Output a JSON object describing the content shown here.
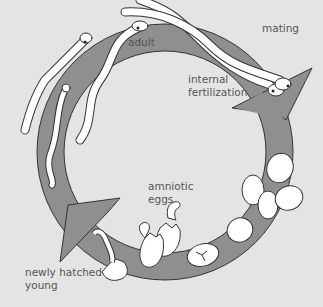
{
  "diagram": {
    "colors": {
      "background": "#e4e4e4",
      "ring": "#8f8f8f",
      "outline": "#333333",
      "animal_fill": "#ffffff",
      "label_text": "#555555"
    },
    "labels": {
      "mating": "mating",
      "adult": "adult",
      "internal_fertilization_1": "internal",
      "internal_fertilization_2": "fertilization",
      "amniotic_eggs_1": "amniotic",
      "amniotic_eggs_2": "eggs",
      "newly_hatched_1": "newly hatched",
      "newly_hatched_2": "young"
    },
    "stages": [
      "adult",
      "mating",
      "internal fertilization",
      "amniotic eggs",
      "newly hatched young"
    ]
  }
}
